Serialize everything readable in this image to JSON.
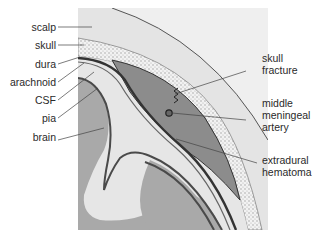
{
  "diagram": {
    "left_labels": [
      {
        "id": "scalp",
        "text": "scalp"
      },
      {
        "id": "skull",
        "text": "skull"
      },
      {
        "id": "dura",
        "text": "dura"
      },
      {
        "id": "arachnoid",
        "text": "arachnoid"
      },
      {
        "id": "csf",
        "text": "CSF"
      },
      {
        "id": "pia",
        "text": "pia"
      },
      {
        "id": "brain",
        "text": "brain"
      }
    ],
    "right_labels": [
      {
        "id": "skull-fracture",
        "line1": "skull",
        "line2": "fracture"
      },
      {
        "id": "middle-meningeal-artery",
        "line1": "middle",
        "line2": "meningeal",
        "line3": "artery"
      },
      {
        "id": "extradural-hematoma",
        "line1": "extradural",
        "line2": "hematoma"
      }
    ],
    "colors": {
      "panel": "#efefef",
      "scalp": "#e4e4e4",
      "skull": "#f2f2f2",
      "skull_dots": "#9a9a9a",
      "dura": "#3a3a3a",
      "hematoma": "#8c8c8c",
      "csf": "#e6e6e6",
      "brain": "#a9a9a9",
      "pia": "#4a4a4a",
      "leader": "#444444"
    }
  }
}
